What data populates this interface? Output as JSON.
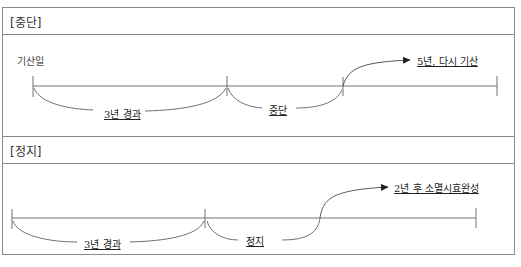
{
  "sections": [
    {
      "title": "[중단]",
      "start_label": "기산일",
      "segments": [
        {
          "label": "3년 경과"
        },
        {
          "label": "중단"
        }
      ],
      "result_label": "5년, 다시 기산"
    },
    {
      "title": "[정지]",
      "segments": [
        {
          "label": "3년 경과"
        },
        {
          "label": "정지"
        }
      ],
      "result_label": "2년 후 소멸시효완성"
    }
  ],
  "colors": {
    "line": "#707070",
    "border": "#8a8a8a",
    "text": "#222222"
  }
}
